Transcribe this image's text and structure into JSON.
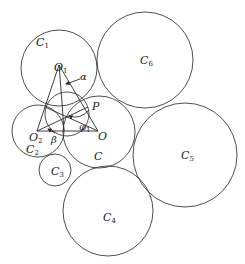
{
  "diagram": {
    "type": "tangent-circle configuration with triangle",
    "colors": {
      "stroke": "#3a3a3a",
      "text": "#222222",
      "background": "#ffffff"
    },
    "circles": [
      {
        "id": "C1",
        "label": "C",
        "sub": "1",
        "cx": 59,
        "cy": 68,
        "r": 38,
        "label_x": 36,
        "label_y": 46
      },
      {
        "id": "C2",
        "label": "C",
        "sub": "2",
        "cx": 38,
        "cy": 131,
        "r": 26,
        "label_x": 26,
        "label_y": 151
      },
      {
        "id": "C",
        "label": "C",
        "sub": "",
        "cx": 99,
        "cy": 132,
        "r": 36,
        "label_x": 94,
        "label_y": 160
      },
      {
        "id": "C3",
        "label": "C",
        "sub": "3",
        "cx": 55,
        "cy": 170,
        "r": 16,
        "label_x": 51,
        "label_y": 175
      },
      {
        "id": "C4",
        "label": "C",
        "sub": "4",
        "cx": 108,
        "cy": 211,
        "r": 45,
        "label_x": 103,
        "label_y": 221
      },
      {
        "id": "C5",
        "label": "C",
        "sub": "5",
        "cx": 185,
        "cy": 155,
        "r": 52,
        "label_x": 181,
        "label_y": 160
      },
      {
        "id": "C6",
        "label": "C",
        "sub": "6",
        "cx": 145,
        "cy": 60,
        "r": 48,
        "label_x": 140,
        "label_y": 65
      },
      {
        "id": "inner",
        "label": "",
        "sub": "",
        "cx": 67,
        "cy": 114,
        "r": 22
      }
    ],
    "points": {
      "O1": {
        "label": "O",
        "sub": "1",
        "x": 59,
        "y": 65,
        "label_x": 52,
        "label_y": 70
      },
      "O2": {
        "label": "O",
        "sub": "2",
        "x": 37,
        "y": 131,
        "label_x": 28,
        "label_y": 139
      },
      "O": {
        "label": "O",
        "sub": "",
        "x": 98,
        "y": 131,
        "label_x": 98,
        "label_y": 139
      },
      "P": {
        "label": "P",
        "sub": "",
        "x": 88,
        "y": 107,
        "label_x": 92,
        "label_y": 108
      }
    },
    "angles": {
      "alpha": {
        "label": "α",
        "x": 80,
        "y": 82
      },
      "beta": {
        "label": "β",
        "x": 51,
        "y": 142
      },
      "phi1": {
        "label": "φ",
        "sub": "1",
        "x": 79,
        "y": 129
      }
    }
  },
  "labels": {
    "C1": "C",
    "C1_sub": "1",
    "C2": "C",
    "C2_sub": "2",
    "C": "C",
    "C3": "C",
    "C3_sub": "3",
    "C4": "C",
    "C4_sub": "4",
    "C5": "C",
    "C5_sub": "5",
    "C6": "C",
    "C6_sub": "6",
    "O1": "O",
    "O1_sub": "1",
    "O2": "O",
    "O2_sub": "2",
    "O": "O",
    "P": "P",
    "alpha": "α",
    "beta": "β",
    "phi1": "φ",
    "phi1_sub": "1"
  }
}
